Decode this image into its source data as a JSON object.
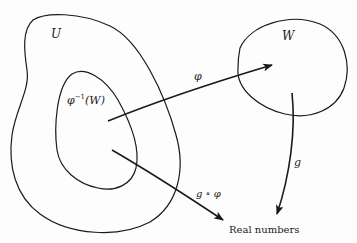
{
  "diagram": {
    "sets": {
      "U": {
        "label": "U"
      },
      "preimage": {
        "label_base": "φ",
        "label_sup": "−1",
        "label_arg": "(W)"
      },
      "W": {
        "label": "W"
      }
    },
    "arrows": {
      "phi": {
        "label": "φ",
        "from": "φ⁻¹(W)",
        "to": "W"
      },
      "g": {
        "label": "g",
        "from": "W",
        "to": "Real numbers"
      },
      "g_compose_phi": {
        "label": "g ∘ φ",
        "from": "φ⁻¹(W)",
        "to": "Real numbers"
      }
    },
    "target": {
      "label": "Real numbers"
    },
    "colors": {
      "stroke": "#1a1a1a",
      "background": "#fdfdfd"
    }
  }
}
